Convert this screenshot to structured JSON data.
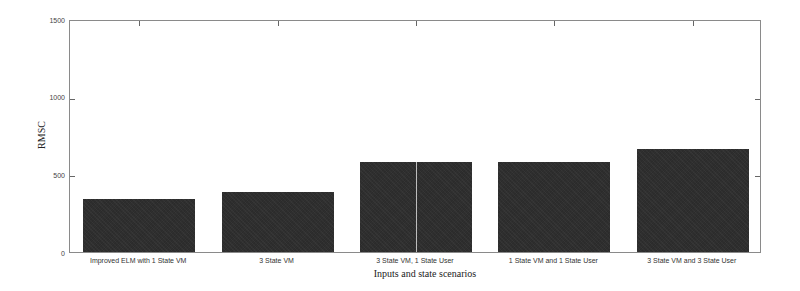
{
  "chart_data": {
    "type": "bar",
    "title": "",
    "xlabel": "Inputs and state scenarios",
    "ylabel": "RMSC",
    "ylim": [
      0,
      1500
    ],
    "yticks": [
      0,
      500,
      1000,
      1500
    ],
    "grid": false,
    "legend": null,
    "categories": [
      "Improved ELM with 1 State VM",
      "3 State VM",
      "3 State VM, 1 State User",
      "1 State VM and 1 State User",
      "3 State VM and 3 State User"
    ],
    "values": [
      340,
      385,
      580,
      580,
      663
    ],
    "bar_color": "#2f2f2f"
  },
  "axis": {
    "ytick_labels": [
      "1500",
      "1000",
      "500",
      "0"
    ]
  }
}
